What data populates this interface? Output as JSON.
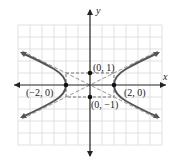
{
  "figure": {
    "type": "hyperbola",
    "equation_implied": "x^2/4 - y^2 = 1",
    "axes": {
      "x_label": "x",
      "y_label": "y"
    },
    "points": [
      {
        "label": "(0, 1)",
        "x": 0,
        "y": 1
      },
      {
        "label": "(0, −1)",
        "x": 0,
        "y": -1
      },
      {
        "label": "(−2, 0)",
        "x": -2,
        "y": 0
      },
      {
        "label": "(2, 0)",
        "x": 2,
        "y": 0
      }
    ],
    "asymptotes": [
      "y = x/2",
      "y = -x/2"
    ],
    "fundamental_rectangle": {
      "x": [
        -2,
        2
      ],
      "y": [
        -1,
        1
      ]
    },
    "colors": {
      "curve": "#555555",
      "grid": "#d8d8d8",
      "axis": "#222222",
      "dashed": "#777777"
    }
  }
}
